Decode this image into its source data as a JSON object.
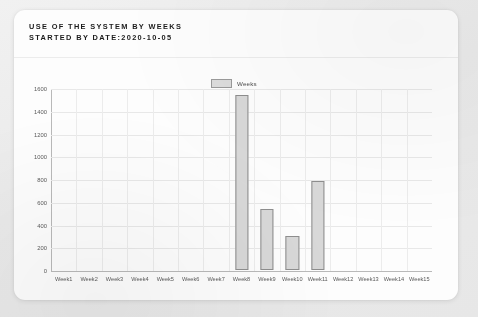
{
  "card": {
    "title_line1": "USE OF THE SYSTEM BY WEEKS",
    "title_line2": "STARTED BY DATE:2020-10-05"
  },
  "legend": {
    "swatch_name": "weeks-swatch",
    "label": "Weeks"
  },
  "colors": {
    "bar_fill": "#d8d8d8",
    "bar_border": "#8e8e8e",
    "grid": "#e8e8e8",
    "axis": "#b9b9b9",
    "card_background": "#fdfdfd",
    "page_background": "#eeeeee",
    "title_text": "#1b1b1b",
    "tick_text": "#5a5a5a"
  },
  "chart_data": {
    "type": "bar",
    "title": "USE OF THE SYSTEM BY WEEKS STARTED BY DATE:2020-10-05",
    "xlabel": "",
    "ylabel": "",
    "categories": [
      "Week1",
      "Week2",
      "Week3",
      "Week4",
      "Week5",
      "Week6",
      "Week7",
      "Week8",
      "Week9",
      "Week10",
      "Week11",
      "Week12",
      "Week13",
      "Week14",
      "Week15"
    ],
    "values": [
      0,
      0,
      0,
      0,
      0,
      0,
      0,
      1540,
      535,
      300,
      780,
      0,
      0,
      0,
      0
    ],
    "series": [
      {
        "name": "Weeks",
        "values": [
          0,
          0,
          0,
          0,
          0,
          0,
          0,
          1540,
          535,
          300,
          780,
          0,
          0,
          0,
          0
        ]
      }
    ],
    "ylim": [
      0,
      1600
    ],
    "yticks": [
      0,
      200,
      400,
      600,
      800,
      1000,
      1200,
      1400,
      1600
    ],
    "ytick_labels": [
      "0",
      "200",
      "400",
      "600",
      "800",
      "1000",
      "1200",
      "1400",
      "1600"
    ],
    "grid": true,
    "legend_position": "top-center"
  }
}
